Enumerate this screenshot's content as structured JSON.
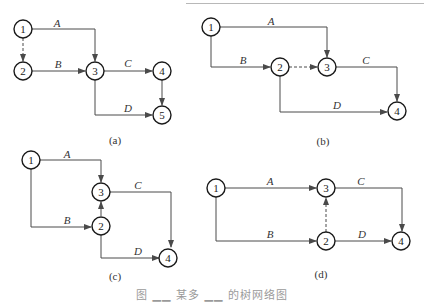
{
  "figure": {
    "caption": "图 ▁▁ 某多 ▁▁ 的树网络图",
    "subfigures": [
      {
        "id": "a",
        "label": "(a)",
        "nodes": [
          {
            "id": "1",
            "label": "1",
            "x": 23,
            "y": 29
          },
          {
            "id": "2",
            "label": "2",
            "x": 23,
            "y": 71
          },
          {
            "id": "3",
            "label": "3",
            "x": 95,
            "y": 71
          },
          {
            "id": "4",
            "label": "4",
            "x": 162,
            "y": 71
          },
          {
            "id": "5",
            "label": "5",
            "x": 162,
            "y": 115
          }
        ],
        "edges": [
          {
            "from": "1",
            "to": "3",
            "label": "A",
            "dashed": false
          },
          {
            "from": "1",
            "to": "2",
            "label": "",
            "dashed": true
          },
          {
            "from": "2",
            "to": "3",
            "label": "B",
            "dashed": false
          },
          {
            "from": "3",
            "to": "4",
            "label": "C",
            "dashed": false
          },
          {
            "from": "3",
            "to": "5",
            "label": "D",
            "dashed": false
          },
          {
            "from": "4",
            "to": "5",
            "label": "",
            "dashed": false
          }
        ]
      },
      {
        "id": "b",
        "label": "(b)",
        "nodes": [
          {
            "id": "1",
            "label": "1",
            "x": 211,
            "y": 27
          },
          {
            "id": "2",
            "label": "2",
            "x": 280,
            "y": 67
          },
          {
            "id": "3",
            "label": "3",
            "x": 327,
            "y": 67
          },
          {
            "id": "4",
            "label": "4",
            "x": 397,
            "y": 111
          }
        ],
        "edges": [
          {
            "from": "1",
            "to": "3",
            "label": "A",
            "dashed": false
          },
          {
            "from": "1",
            "to": "2",
            "label": "B",
            "dashed": false
          },
          {
            "from": "2",
            "to": "3",
            "label": "",
            "dashed": true
          },
          {
            "from": "3",
            "to": "4",
            "label": "C",
            "dashed": false
          },
          {
            "from": "2",
            "to": "4",
            "label": "D",
            "dashed": false
          }
        ]
      },
      {
        "id": "c",
        "label": "(c)",
        "nodes": [
          {
            "id": "1",
            "label": "1",
            "x": 31,
            "y": 160
          },
          {
            "id": "2",
            "label": "2",
            "x": 101,
            "y": 225
          },
          {
            "id": "3",
            "label": "3",
            "x": 101,
            "y": 192
          },
          {
            "id": "4",
            "label": "4",
            "x": 168,
            "y": 257
          }
        ],
        "edges": [
          {
            "from": "1",
            "to": "3",
            "label": "A",
            "dashed": false
          },
          {
            "from": "1",
            "to": "2",
            "label": "B",
            "dashed": false
          },
          {
            "from": "2",
            "to": "3",
            "label": "",
            "dashed": false
          },
          {
            "from": "3",
            "to": "4",
            "label": "C",
            "dashed": false
          },
          {
            "from": "2",
            "to": "4",
            "label": "D",
            "dashed": false
          }
        ]
      },
      {
        "id": "d",
        "label": "(d)",
        "nodes": [
          {
            "id": "1",
            "label": "1",
            "x": 216,
            "y": 188
          },
          {
            "id": "2",
            "label": "2",
            "x": 326,
            "y": 241
          },
          {
            "id": "3",
            "label": "3",
            "x": 326,
            "y": 188
          },
          {
            "id": "4",
            "label": "4",
            "x": 401,
            "y": 241
          }
        ],
        "edges": [
          {
            "from": "1",
            "to": "3",
            "label": "A",
            "dashed": false
          },
          {
            "from": "1",
            "to": "2",
            "label": "B",
            "dashed": false
          },
          {
            "from": "2",
            "to": "3",
            "label": "",
            "dashed": true
          },
          {
            "from": "3",
            "to": "4",
            "label": "C",
            "dashed": false
          },
          {
            "from": "2",
            "to": "4",
            "label": "D",
            "dashed": false
          }
        ]
      }
    ]
  },
  "style": {
    "line_color": "#4a4a4a",
    "node_stroke": "#1a1a1a",
    "text_color": "#333333"
  }
}
